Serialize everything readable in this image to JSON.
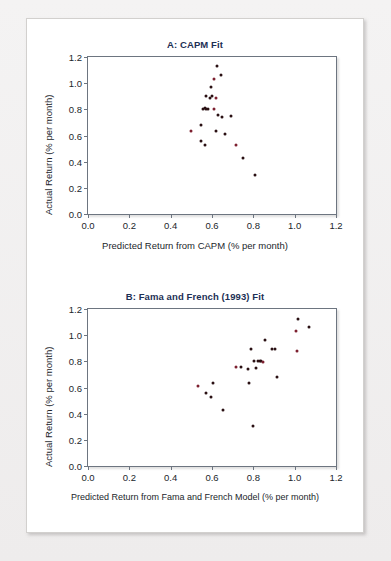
{
  "figure": {
    "background_color": "#eceaea",
    "card_color": "#ffffff",
    "title_color": "#1d3055",
    "point_color": "#2a1013"
  },
  "chart_data": [
    {
      "type": "scatter",
      "panel": "A",
      "title": "A: CAPM Fit",
      "xlabel": "Predicted Return from CAPM (% per month)",
      "ylabel": "Actual Return (% per month)",
      "xlim": [
        0.0,
        1.2
      ],
      "ylim": [
        0.0,
        1.2
      ],
      "xticks": [
        "0.0",
        "0.2",
        "0.4",
        "0.6",
        "0.8",
        "1.0",
        "1.2"
      ],
      "xtick_values": [
        0.0,
        0.2,
        0.4,
        0.6,
        0.8,
        1.0,
        1.2
      ],
      "yticks": [
        "0.0",
        "0.2",
        "0.4",
        "0.6",
        "0.8",
        "1.0",
        "1.2"
      ],
      "ytick_values": [
        0.0,
        0.2,
        0.4,
        0.6,
        0.8,
        1.0,
        1.2
      ],
      "grid": false,
      "legend": null,
      "x": [
        0.624,
        0.645,
        0.608,
        0.596,
        0.57,
        0.6,
        0.588,
        0.62,
        0.566,
        0.558,
        0.572,
        0.58,
        0.612,
        0.628,
        0.646,
        0.69,
        0.545,
        0.5,
        0.618,
        0.664,
        0.548,
        0.568,
        0.718,
        0.752,
        0.806
      ],
      "y": [
        1.13,
        1.06,
        1.03,
        0.97,
        0.9,
        0.905,
        0.89,
        0.885,
        0.81,
        0.8,
        0.8,
        0.8,
        0.8,
        0.76,
        0.74,
        0.75,
        0.68,
        0.635,
        0.635,
        0.615,
        0.555,
        0.53,
        0.525,
        0.43,
        0.3
      ]
    },
    {
      "type": "scatter",
      "panel": "B",
      "title": "B: Fama and French (1993) Fit",
      "xlabel": "Predicted Return from Fama and French Model (% per month)",
      "ylabel": "Actual Return (% per month)",
      "xlim": [
        0.0,
        1.2
      ],
      "ylim": [
        0.0,
        1.2
      ],
      "xticks": [
        "0.0",
        "0.2",
        "0.4",
        "0.6",
        "0.8",
        "1.0",
        "1.2"
      ],
      "xtick_values": [
        0.0,
        0.2,
        0.4,
        0.6,
        0.8,
        1.0,
        1.2
      ],
      "yticks": [
        "0.0",
        "0.2",
        "0.4",
        "0.6",
        "0.8",
        "1.0",
        "1.2"
      ],
      "ytick_values": [
        0.0,
        0.2,
        0.4,
        0.6,
        0.8,
        1.0,
        1.2
      ],
      "grid": false,
      "legend": null,
      "x": [
        1.015,
        1.07,
        1.005,
        0.855,
        0.79,
        0.89,
        0.905,
        1.01,
        0.83,
        0.805,
        0.822,
        0.838,
        0.845,
        0.815,
        0.775,
        0.742,
        0.915,
        0.53,
        0.605,
        0.778,
        0.57,
        0.595,
        0.718,
        0.655,
        0.8
      ],
      "y": [
        1.125,
        1.06,
        1.03,
        0.96,
        0.895,
        0.895,
        0.895,
        0.88,
        0.805,
        0.8,
        0.8,
        0.8,
        0.795,
        0.75,
        0.74,
        0.755,
        0.68,
        0.615,
        0.635,
        0.635,
        0.555,
        0.528,
        0.755,
        0.428,
        0.303
      ]
    }
  ]
}
